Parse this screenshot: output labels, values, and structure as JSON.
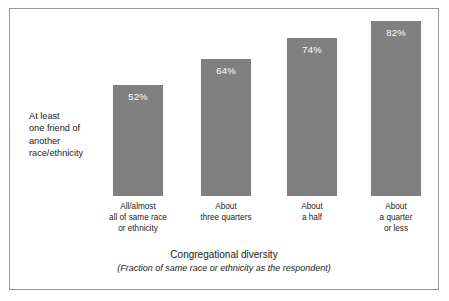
{
  "chart_data": {
    "type": "bar",
    "title": "",
    "categories": [
      "All/almost\nall of same race\nor ethnicity",
      "About\nthree quarters",
      "About\na half",
      "About\na quarter\nor less"
    ],
    "category_lines": [
      [
        "All/almost",
        "all of same race",
        "or ethnicity"
      ],
      [
        "About",
        "three quarters"
      ],
      [
        "About",
        "a half"
      ],
      [
        "About",
        "a quarter",
        "or less"
      ]
    ],
    "values": [
      52,
      64,
      74,
      82
    ],
    "value_labels": [
      "52%",
      "64%",
      "74%",
      "82%"
    ],
    "ylabel": "At least one friend of another race/ethnicity",
    "ylabel_lines": [
      "At least",
      "one friend of",
      "another",
      "race/ethnicity"
    ],
    "xlabel": "Congregational diversity",
    "xlabel_subtitle": "(Fraction of same race or ethnicity as the respondent)",
    "ylim": [
      0,
      100
    ],
    "grid": false,
    "legend": "none",
    "bar_color": "#808080",
    "value_label_color": "#ffffff",
    "frame_color": "#9a9a9a",
    "background": "#ffffff"
  },
  "ylabel": {
    "line1": "At least",
    "line2": "one friend of",
    "line3": "another",
    "line4": "race/ethnicity"
  },
  "bars": [
    {
      "value_label": "52%",
      "cat_line1": "All/almost",
      "cat_line2": "all of same race",
      "cat_line3": "or ethnicity"
    },
    {
      "value_label": "64%",
      "cat_line1": "About",
      "cat_line2": "three quarters",
      "cat_line3": ""
    },
    {
      "value_label": "74%",
      "cat_line1": "About",
      "cat_line2": "a half",
      "cat_line3": ""
    },
    {
      "value_label": "82%",
      "cat_line1": "About",
      "cat_line2": "a quarter",
      "cat_line3": "or less"
    }
  ],
  "axis": {
    "x_title": "Congregational diversity",
    "x_subtitle": "(Fraction of same race or ethnicity as the respondent)"
  }
}
